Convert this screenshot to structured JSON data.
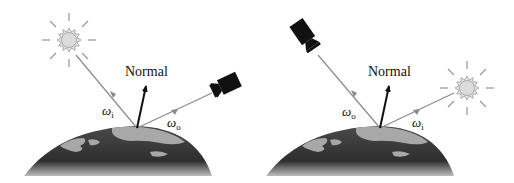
{
  "figure": {
    "panels": [
      {
        "id": "left",
        "normal_label": "Normal",
        "incoming_symbol": "ω",
        "incoming_subscript": "i",
        "outgoing_symbol": "ω",
        "outgoing_subscript": "o",
        "light_source": "sun-icon",
        "viewer": "camera-icon",
        "light_position": "upper-left",
        "viewer_position": "right"
      },
      {
        "id": "right",
        "normal_label": "Normal",
        "incoming_symbol": "ω",
        "incoming_subscript": "i",
        "outgoing_symbol": "ω",
        "outgoing_subscript": "o",
        "light_source": "sun-icon",
        "viewer": "camera-icon",
        "light_position": "right",
        "viewer_position": "upper-left"
      }
    ],
    "colors": {
      "ray": "#8a8a8a",
      "normal_arrow": "#111111",
      "sun_fill": "#dcdcdc",
      "sun_stroke": "#9a9a9a",
      "camera": "#111111",
      "ocean": "#3a3a3a",
      "land": "#a8a8a8"
    }
  }
}
